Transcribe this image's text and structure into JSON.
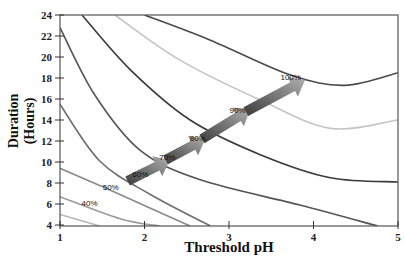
{
  "chart_data": {
    "type": "line",
    "subtype": "contour",
    "title": "",
    "xlabel": "Threshold pH",
    "ylabel": "Duration (Hours)",
    "ylabel_lines": [
      "Duration",
      "(Hours)"
    ],
    "xlim": [
      1,
      5
    ],
    "ylim": [
      4,
      24
    ],
    "x_ticks": [
      1,
      2,
      3,
      4,
      5
    ],
    "y_ticks": [
      4,
      6,
      8,
      10,
      12,
      14,
      16,
      18,
      20,
      22,
      24
    ],
    "grid": false,
    "legend": null,
    "series": [
      {
        "name": "30%",
        "color": "#b8b8b8",
        "points": [
          [
            1.0,
            5.0
          ],
          [
            1.47,
            3.9
          ]
        ]
      },
      {
        "name": "40%",
        "color": "#9a9a9a",
        "points": [
          [
            1.0,
            6.7
          ],
          [
            1.71,
            4.6
          ],
          [
            2.18,
            3.9
          ]
        ]
      },
      {
        "name": "50%",
        "color": "#8a8a8a",
        "points": [
          [
            1.0,
            9.4
          ],
          [
            1.71,
            6.9
          ],
          [
            2.54,
            3.9
          ]
        ]
      },
      {
        "name": "60%",
        "color": "#6e6e6e",
        "points": [
          [
            1.0,
            15.5
          ],
          [
            1.47,
            10.1
          ],
          [
            2.07,
            6.9
          ],
          [
            2.78,
            3.9
          ]
        ]
      },
      {
        "name": "70%",
        "color": "#555555",
        "points": [
          [
            1.0,
            22.8
          ],
          [
            1.41,
            16.4
          ],
          [
            1.95,
            11.1
          ],
          [
            2.66,
            8.3
          ],
          [
            3.84,
            5.9
          ],
          [
            4.76,
            3.9
          ]
        ]
      },
      {
        "name": "80%",
        "color": "#3a3a3a",
        "points": [
          [
            1.26,
            24.0
          ],
          [
            1.83,
            18.8
          ],
          [
            2.54,
            14.0
          ],
          [
            3.37,
            10.7
          ],
          [
            4.2,
            8.5
          ],
          [
            5.0,
            8.1
          ]
        ]
      },
      {
        "name": "90%",
        "color": "#c4c4c4",
        "points": [
          [
            1.65,
            24.0
          ],
          [
            2.42,
            19.7
          ],
          [
            3.37,
            15.9
          ],
          [
            4.2,
            13.2
          ],
          [
            5.0,
            14.0
          ]
        ]
      },
      {
        "name": "100%",
        "color": "#4a4a4a",
        "points": [
          [
            2.0,
            24.0
          ],
          [
            2.78,
            21.6
          ],
          [
            3.72,
            18.3
          ],
          [
            4.37,
            17.3
          ],
          [
            5.0,
            18.5
          ]
        ]
      }
    ],
    "annotations": [
      {
        "text": "40%",
        "x": 1.35,
        "y": 5.8
      },
      {
        "text": "50%",
        "x": 1.6,
        "y": 7.3
      },
      {
        "text": "60%",
        "x": 1.95,
        "y": 8.6
      },
      {
        "text": "70%",
        "x": 2.27,
        "y": 10.2
      },
      {
        "text": "80%",
        "x": 2.63,
        "y": 12.0
      },
      {
        "text": "90%",
        "x": 3.1,
        "y": 14.7
      },
      {
        "text": "100%",
        "x": 3.73,
        "y": 17.8
      }
    ],
    "arrows": [
      {
        "from": [
          1.8,
          8.2
        ],
        "to": [
          2.3,
          10.2
        ]
      },
      {
        "from": [
          2.25,
          10.2
        ],
        "to": [
          2.72,
          12.2
        ]
      },
      {
        "from": [
          2.68,
          12.2
        ],
        "to": [
          3.25,
          15.0
        ]
      },
      {
        "from": [
          3.2,
          14.8
        ],
        "to": [
          3.9,
          17.8
        ]
      }
    ]
  }
}
